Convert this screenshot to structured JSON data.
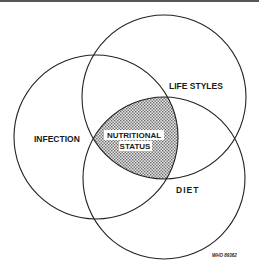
{
  "diagram": {
    "type": "venn",
    "circles": [
      {
        "id": "infection",
        "label": "INFECTION",
        "cx": 96,
        "cy": 137,
        "r": 82
      },
      {
        "id": "life-styles",
        "label": "LIFE STYLES",
        "cx": 164,
        "cy": 97,
        "r": 82
      },
      {
        "id": "diet",
        "label": "DIET",
        "cx": 164,
        "cy": 178,
        "r": 81
      }
    ],
    "center": {
      "label_line1": "NUTRITIONAL",
      "label_line2": "STATUS",
      "fill": "stippled grey"
    },
    "credit": "WHO 89362"
  },
  "colors": {
    "stroke": "#222222",
    "background": "#ffffff",
    "stipple": "#7a7a7a"
  }
}
